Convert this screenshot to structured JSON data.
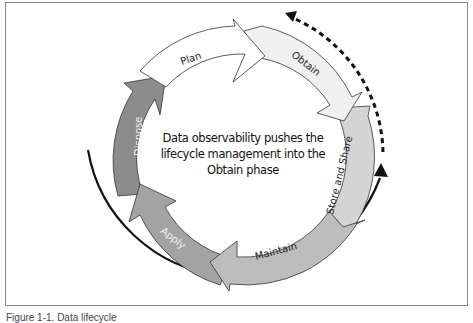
{
  "diagram": {
    "center_text": "Data observability pushes the lifecycle management into the Obtain phase",
    "stages": [
      {
        "label": "Plan",
        "fill": "#ffffff",
        "text_color": "#222222"
      },
      {
        "label": "Obtain",
        "fill": "#f0f0f0",
        "text_color": "#222222"
      },
      {
        "label": "Store and Share",
        "fill": "#d4d4d4",
        "text_color": "#222222"
      },
      {
        "label": "Maintain",
        "fill": "#bdbdbd",
        "text_color": "#222222"
      },
      {
        "label": "Apply",
        "fill": "#a3a3a3",
        "text_color": "#f2f2f2"
      },
      {
        "label": "Dispose",
        "fill": "#8c8c8c",
        "text_color": "#f2f2f2"
      }
    ],
    "solid_arrow": {
      "style": "solid",
      "direction": "counterclockwise-up"
    },
    "dashed_arrow": {
      "style": "dashed",
      "direction": "toward-obtain"
    },
    "caption": "Figure 1-1. Data lifecycle"
  }
}
